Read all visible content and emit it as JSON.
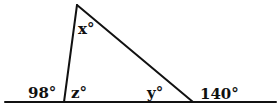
{
  "figure": {
    "type": "triangle-exterior-angles",
    "line_color": "#111111",
    "background": "#ffffff",
    "baseline": {
      "x1": 5,
      "y1": 102,
      "x2": 276,
      "y2": 102
    },
    "vertices": {
      "apex": {
        "x": 77,
        "y": 5
      },
      "bottom_left": {
        "x": 64,
        "y": 102
      },
      "bottom_right": {
        "x": 193,
        "y": 102
      }
    },
    "labels": {
      "x": "x°",
      "y": "y°",
      "z": "z°",
      "exterior_left": "98°",
      "exterior_right": "140°"
    }
  }
}
